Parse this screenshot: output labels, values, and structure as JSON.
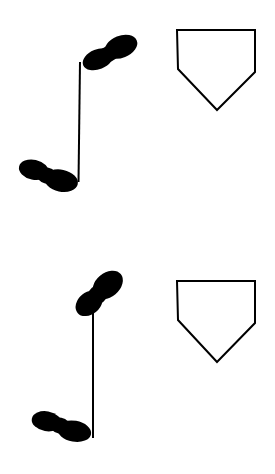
{
  "figures": [
    {
      "name": "footprint-note-1",
      "icon": "footprint-eighth-note-icon",
      "color": "#000000"
    },
    {
      "name": "footprint-note-2",
      "icon": "footprint-eighth-note-icon",
      "color": "#000000"
    }
  ],
  "plates": [
    {
      "name": "home-plate-1",
      "icon": "home-plate-icon",
      "stroke": "#000000",
      "fill": "#ffffff"
    },
    {
      "name": "home-plate-2",
      "icon": "home-plate-icon",
      "stroke": "#000000",
      "fill": "#ffffff"
    }
  ]
}
